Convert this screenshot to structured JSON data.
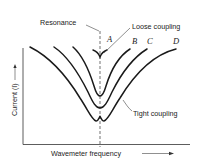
{
  "diagram": {
    "title": "",
    "x_axis_label": "Wavemeter frequency",
    "y_axis_label": "Current (I)",
    "annotations": {
      "resonance": "Resonance",
      "loose_coupling": "Loose coupling",
      "tight_coupling": "Tight coupling"
    },
    "curves": [
      {
        "label": "A",
        "description": "loosest coupling, sharp narrow dip at resonance"
      },
      {
        "label": "B",
        "description": "loose coupling, narrow dip"
      },
      {
        "label": "C",
        "description": "moderate coupling, wider deeper dip"
      },
      {
        "label": "D",
        "description": "tight coupling, broad dip with double minimum"
      }
    ],
    "colors": {
      "line": "#1a1a1a",
      "background": "#ffffff"
    }
  }
}
